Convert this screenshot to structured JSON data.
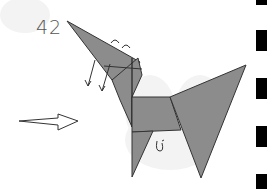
{
  "diagram": {
    "step_number": "42",
    "colors": {
      "paper": "#8c8c8c",
      "outline": "#333333",
      "background": "#ffffff",
      "watermark": "#f2f2f2",
      "edge_bars": "#000000"
    },
    "arrows": [
      "valley-fold-arrow-left",
      "valley-fold-arrow-right",
      "direction-arrow"
    ],
    "edge_bars_y": [
      [
        0,
        5
      ],
      [
        30,
        51
      ],
      [
        78,
        99
      ],
      [
        126,
        147
      ],
      [
        174,
        189
      ]
    ]
  }
}
